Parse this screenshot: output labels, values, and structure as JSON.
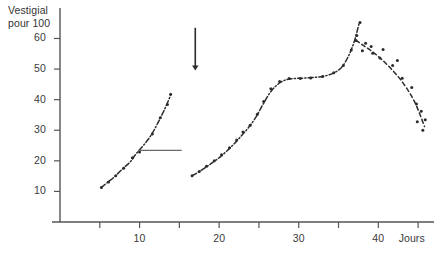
{
  "chart_data": {
    "type": "scatter",
    "title": "",
    "ylabel": "Vestigial\npour 100",
    "xlabel": "Jours",
    "xlim": [
      0,
      47
    ],
    "ylim": [
      0,
      68
    ],
    "grid": false,
    "legend": "none",
    "y_ticks": [
      10,
      20,
      30,
      40,
      50,
      60
    ],
    "y_tick_labels": [
      "10",
      "20",
      "30",
      "40",
      "50",
      "60"
    ],
    "x_ticks": [
      5,
      10,
      15,
      20,
      25,
      30,
      35,
      40,
      45
    ],
    "x_tick_labels": [
      "",
      "10",
      "",
      "20",
      "",
      "30",
      "",
      "40",
      ""
    ],
    "series": [
      {
        "name": "segment-1-rising",
        "style": "dash-dot-with-points",
        "x": [
          5.2,
          6.0,
          6.9,
          7.9,
          8.8,
          9.6,
          10.6,
          11.5,
          12.3,
          13.1,
          13.9
        ],
        "y": [
          11.3,
          13.0,
          14.9,
          17.5,
          19.6,
          22.4,
          25.4,
          28.6,
          32.4,
          36.6,
          41.4
        ]
      },
      {
        "name": "segment-2-rising-plateau-peak",
        "style": "dash-dot-with-points",
        "x": [
          16.6,
          17.4,
          18.3,
          19.2,
          20.1,
          21.0,
          21.9,
          22.8,
          23.7,
          24.6,
          25.5,
          26.6,
          27.8,
          29.0,
          30.3,
          31.6,
          33.0,
          34.3,
          35.4,
          36.3,
          37.0,
          37.6
        ],
        "y": [
          15.1,
          16.3,
          17.8,
          19.5,
          21.2,
          23.3,
          25.6,
          28.2,
          30.9,
          34.2,
          38.4,
          43.0,
          45.8,
          46.8,
          47.0,
          47.2,
          47.6,
          48.6,
          50.6,
          54.5,
          59.2,
          65.0
        ]
      },
      {
        "name": "segment-3-dashed-decline",
        "style": "dashed-with-points",
        "x": [
          37.2,
          38.2,
          39.3,
          40.4,
          41.5,
          42.6,
          43.6,
          44.5,
          45.2,
          45.8
        ],
        "y": [
          59.4,
          57.6,
          55.6,
          53.2,
          50.4,
          47.2,
          43.6,
          39.6,
          35.4,
          31.2
        ]
      }
    ],
    "scatter_points": [
      {
        "x": 5.2,
        "y": 11.3
      },
      {
        "x": 6.1,
        "y": 13.1
      },
      {
        "x": 7.0,
        "y": 15.1
      },
      {
        "x": 8.0,
        "y": 17.6
      },
      {
        "x": 9.1,
        "y": 21.0
      },
      {
        "x": 10.0,
        "y": 22.9
      },
      {
        "x": 11.6,
        "y": 28.8
      },
      {
        "x": 12.6,
        "y": 34.1
      },
      {
        "x": 13.5,
        "y": 38.4
      },
      {
        "x": 13.9,
        "y": 41.8
      },
      {
        "x": 16.6,
        "y": 15.1
      },
      {
        "x": 17.5,
        "y": 16.5
      },
      {
        "x": 18.4,
        "y": 18.2
      },
      {
        "x": 19.4,
        "y": 20.0
      },
      {
        "x": 20.3,
        "y": 22.0
      },
      {
        "x": 21.3,
        "y": 24.3
      },
      {
        "x": 22.2,
        "y": 26.8
      },
      {
        "x": 23.0,
        "y": 29.4
      },
      {
        "x": 23.9,
        "y": 31.6
      },
      {
        "x": 24.8,
        "y": 35.2
      },
      {
        "x": 25.6,
        "y": 39.4
      },
      {
        "x": 26.5,
        "y": 43.6
      },
      {
        "x": 27.6,
        "y": 45.9
      },
      {
        "x": 28.8,
        "y": 46.9
      },
      {
        "x": 30.2,
        "y": 46.9
      },
      {
        "x": 31.5,
        "y": 47.1
      },
      {
        "x": 33.0,
        "y": 47.6
      },
      {
        "x": 34.4,
        "y": 48.8
      },
      {
        "x": 35.6,
        "y": 51.2
      },
      {
        "x": 36.6,
        "y": 56.2
      },
      {
        "x": 37.3,
        "y": 61.0
      },
      {
        "x": 37.7,
        "y": 65.2
      },
      {
        "x": 37.2,
        "y": 59.3
      },
      {
        "x": 38.4,
        "y": 58.4
      },
      {
        "x": 38.0,
        "y": 56.0
      },
      {
        "x": 39.3,
        "y": 55.2
      },
      {
        "x": 39.1,
        "y": 57.4
      },
      {
        "x": 40.2,
        "y": 53.6
      },
      {
        "x": 40.6,
        "y": 56.4
      },
      {
        "x": 41.8,
        "y": 51.2
      },
      {
        "x": 42.4,
        "y": 52.8
      },
      {
        "x": 43.0,
        "y": 47.0
      },
      {
        "x": 44.2,
        "y": 44.0
      },
      {
        "x": 44.8,
        "y": 38.6
      },
      {
        "x": 45.4,
        "y": 36.2
      },
      {
        "x": 44.9,
        "y": 32.8
      },
      {
        "x": 45.6,
        "y": 30.0
      },
      {
        "x": 45.9,
        "y": 33.4
      }
    ],
    "annotations": [
      {
        "name": "treatment-arrow",
        "type": "arrow-down",
        "x": 17.0,
        "y_top": 63.5,
        "y_bottom": 49.5
      },
      {
        "name": "reference-line",
        "type": "horizontal-line",
        "y": 23.4,
        "x_start": 9.9,
        "x_end": 15.3
      }
    ],
    "colors": {
      "axis": "#555555",
      "data": "#2b2b2b",
      "annotation": "#6a6a6a",
      "text": "#3a3a3a"
    }
  }
}
